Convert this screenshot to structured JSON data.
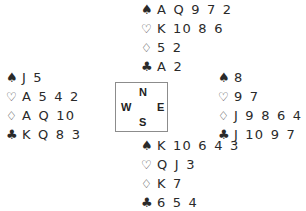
{
  "suits": {
    "spades": "♠",
    "hearts": "♡",
    "diamonds": "♢",
    "clubs": "♣"
  },
  "hands": {
    "north": {
      "spades": "A Q 9 7 2",
      "hearts": "K 10 8 6",
      "diamonds": "5 2",
      "clubs": "A 2"
    },
    "west": {
      "spades": "J 5",
      "hearts": "A 5 4 2",
      "diamonds": "A Q 10",
      "clubs": "K Q 8 3"
    },
    "east": {
      "spades": "8",
      "hearts": "9 7",
      "diamonds": "J 9 8 6 4 3",
      "clubs": "J 10 9 7"
    },
    "south": {
      "spades": "K 10 6 4 3",
      "hearts": "Q J 3",
      "diamonds": "K 7",
      "clubs": "6 5 4"
    }
  },
  "compass": {
    "north": "N",
    "south": "S",
    "west": "W",
    "east": "E"
  }
}
